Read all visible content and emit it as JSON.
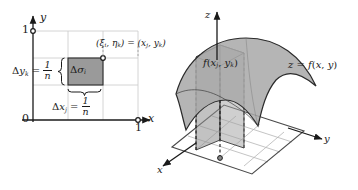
{
  "figure": {
    "colors": {
      "ink": "#1a1a1a",
      "grid_light": "#c9c9c9",
      "cell_fill": "#9a9a9a",
      "surface_fill": "#a8a8a8",
      "surface_fill_light": "#bcbcbc",
      "column_fill": "#8f8f8f",
      "base_grid": "#b5b5b5"
    }
  },
  "left_panel": {
    "name": "domain-partition-diagram",
    "axes": {
      "x_label": "x",
      "y_label": "y",
      "origin_label": "0",
      "x_tick_label": "1",
      "y_tick_label": "1"
    },
    "cell": {
      "area_label_delta": "Δ",
      "area_label_sigma": "σ",
      "area_label_sub": "i",
      "corner_point_label_parts": {
        "open": "(",
        "xi": "ξ",
        "xi_sub": "i",
        "comma": ", ",
        "eta": "η",
        "eta_sub": "k",
        "close": ")",
        "equals": " = ",
        "open2": "(",
        "x": "x",
        "x_sub": "j",
        "comma2": ", ",
        "y": "y",
        "y_sub": "k",
        "close2": ")"
      }
    },
    "width_label": {
      "delta": "Δ",
      "var": "x",
      "sub": "j",
      "equals": " = ",
      "numerator": "1",
      "denominator": "n"
    },
    "height_label": {
      "delta": "Δ",
      "var": "y",
      "sub": "k",
      "equals": " = ",
      "numerator": "1",
      "denominator": "n"
    }
  },
  "right_panel": {
    "name": "surface-column-diagram",
    "axes": {
      "x_label": "x",
      "y_label": "y",
      "z_label": "z"
    },
    "surface_label": {
      "z": "z",
      "equals": " = ",
      "f": "f",
      "open": "(",
      "x": "x",
      "comma": ", ",
      "y": "y",
      "close": ")"
    },
    "column_height_label": {
      "f": "f",
      "open": "(",
      "x": "x",
      "x_sub": "j",
      "comma": ", ",
      "y": "y",
      "y_sub": "k",
      "close": ")"
    }
  }
}
